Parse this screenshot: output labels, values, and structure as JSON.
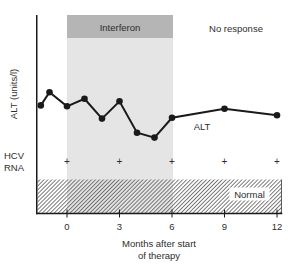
{
  "figure": {
    "y_axis_label": "ALT (units/l)",
    "x_axis_label_line1": "Months after start",
    "x_axis_label_line2": "of therapy",
    "interferon_band_label": "Interferon",
    "no_response_label": "No response",
    "series_label": "ALT",
    "hcv_row_label_line1": "HCV",
    "hcv_row_label_line2": "RNA",
    "normal_band_label": "Normal",
    "colors": {
      "interferon_header_fill": "#b5b5b5",
      "interferon_region_fill": "#e5e5e5",
      "line_color": "#1a1a1a",
      "hatch_line_color": "#5a5a5a",
      "axis_color": "#1a1a1a",
      "text_color": "#2e2e2e"
    }
  },
  "chart_data": {
    "type": "line",
    "title": "",
    "xlabel": "Months after start of therapy",
    "ylabel": "ALT (units/l)",
    "x_ticks": [
      0,
      3,
      6,
      9,
      12
    ],
    "xlim": [
      -1.75,
      12.3
    ],
    "ylim": [
      0,
      240
    ],
    "grid": "off",
    "y_tick_labels": "none",
    "x_months": [
      -1.5,
      -1,
      0,
      1,
      2,
      3,
      4,
      5,
      6,
      9,
      12
    ],
    "series": [
      {
        "name": "ALT",
        "values": [
          131,
          147,
          130,
          139,
          115,
          136,
          98,
          92,
          116,
          127,
          119
        ]
      }
    ],
    "interferon_period_months": [
      0,
      6
    ],
    "normal_range_units": [
      0,
      40
    ],
    "hcv_rna_marker": "+",
    "hcv_rna_marker_months": [
      0,
      3,
      6,
      9,
      12
    ],
    "annotations": [
      "Interferon",
      "No response",
      "ALT",
      "HCV RNA",
      "Normal"
    ]
  }
}
